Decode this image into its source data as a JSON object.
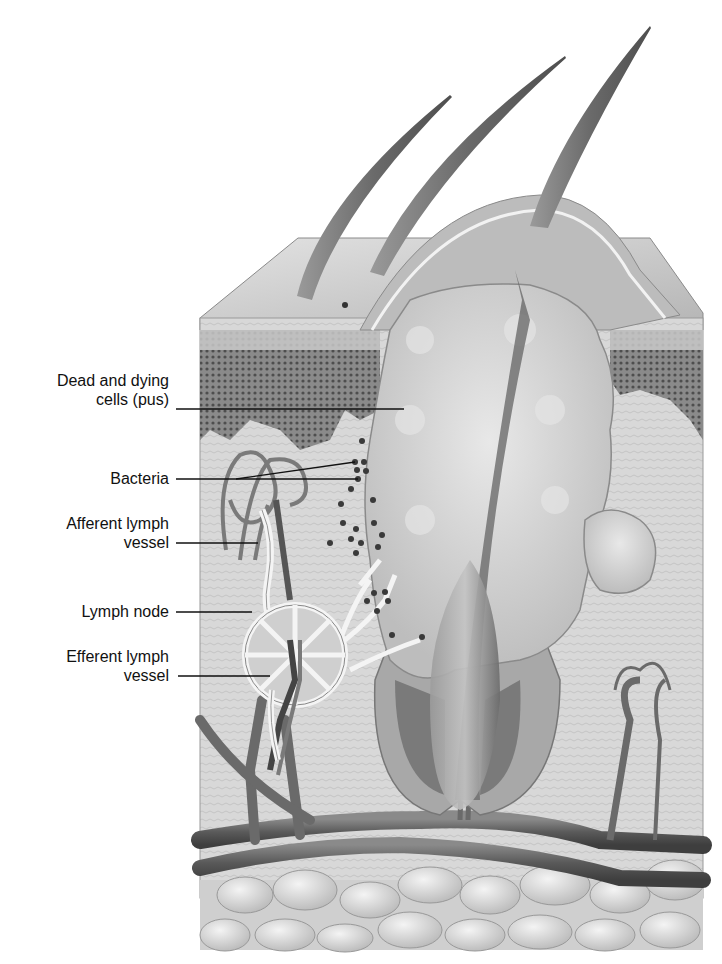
{
  "figure": {
    "style": "grayscale medical illustration"
  },
  "labels": [
    {
      "id": "pus",
      "line1": "Dead and dying",
      "line2": "cells (pus)"
    },
    {
      "id": "bacteria",
      "line1": "Bacteria"
    },
    {
      "id": "afferent",
      "line1": "Afferent lymph",
      "line2": "vessel"
    },
    {
      "id": "node",
      "line1": "Lymph node"
    },
    {
      "id": "efferent",
      "line1": "Efferent lymph",
      "line2": "vessel"
    }
  ],
  "colors": {
    "background": "#ffffff",
    "skin_surface": "#c9c9c9",
    "epidermis_dark": "#6e6e6e",
    "dermis": "#d6d6d6",
    "pus": "#cfcfcf",
    "hair": "#7a7a7a",
    "vessel": "#5e5e5e",
    "fat": "#dcdcdc",
    "bacteria": "#3a3a3a",
    "label_text": "#111111",
    "leader_line": "#111111"
  }
}
